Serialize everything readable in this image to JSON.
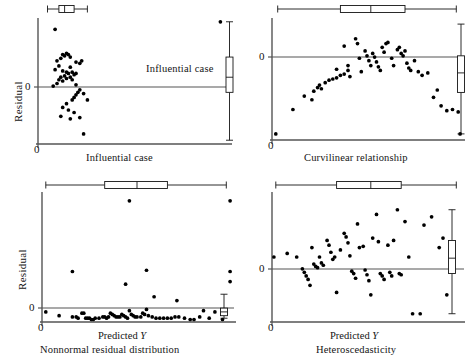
{
  "figure": {
    "title": "",
    "panels": [
      {
        "id": "influential-case",
        "caption": "Influential case",
        "xlabel": "",
        "ylabel": "Residual",
        "zero_tick": "0",
        "x_origin_tick": "0",
        "annotation": "Influential case"
      },
      {
        "id": "curvilinear-relationship",
        "caption": "Curvilinear relationship",
        "xlabel": "",
        "ylabel": "",
        "zero_tick": "0",
        "x_origin_tick": "0",
        "annotation": ""
      },
      {
        "id": "nonnormal-residual-distribution",
        "caption": "Nonnormal residual distribution",
        "xlabel_main": "Predicted",
        "xlabel_var": "Y",
        "ylabel": "Residual",
        "zero_tick": "0",
        "x_origin_tick": "0",
        "annotation": ""
      },
      {
        "id": "heteroscedasticity",
        "caption": "Heteroscedasticity",
        "xlabel_main": "Predicted",
        "xlabel_var": "Y",
        "ylabel": "",
        "zero_tick": "0",
        "x_origin_tick": "0",
        "annotation": ""
      }
    ],
    "colors": {
      "ink": "#141414",
      "axis": "#555555",
      "point": "#000000",
      "page": "#ffffff"
    }
  },
  "chart_data": [
    {
      "type": "scatter",
      "title": "Influential case",
      "xlabel": "",
      "ylabel": "Residual",
      "xlim": [
        0,
        100
      ],
      "ylim": [
        -55,
        45
      ],
      "grid": false,
      "legend": null,
      "annotations": [
        {
          "text": "Influential case",
          "x": 96,
          "y": 6,
          "note": "labels the single far-right outlying point"
        }
      ],
      "reference_lines": [
        {
          "orientation": "horizontal",
          "y": 0
        }
      ],
      "marginal_boxplots": {
        "x": {
          "min": 5,
          "q1": 11,
          "median": 14,
          "q3": 19,
          "max": 26,
          "position": "top"
        },
        "y": {
          "min": -52,
          "q1": -14,
          "median": -2,
          "q3": 14,
          "max": 42,
          "position": "right"
        }
      },
      "points": [
        {
          "x": 9,
          "y": 36
        },
        {
          "x": 13,
          "y": 16
        },
        {
          "x": 15,
          "y": 17
        },
        {
          "x": 14,
          "y": 15
        },
        {
          "x": 16,
          "y": 16
        },
        {
          "x": 17,
          "y": 14
        },
        {
          "x": 12,
          "y": 13
        },
        {
          "x": 10,
          "y": 11
        },
        {
          "x": 20,
          "y": 10
        },
        {
          "x": 23,
          "y": 11
        },
        {
          "x": 22,
          "y": 9
        },
        {
          "x": 11,
          "y": 7
        },
        {
          "x": 17,
          "y": 6
        },
        {
          "x": 9,
          "y": 4
        },
        {
          "x": 13,
          "y": 3
        },
        {
          "x": 15,
          "y": 2
        },
        {
          "x": 16,
          "y": 1
        },
        {
          "x": 18,
          "y": 2
        },
        {
          "x": 19,
          "y": 0
        },
        {
          "x": 20,
          "y": 1
        },
        {
          "x": 14,
          "y": -1
        },
        {
          "x": 12,
          "y": -2
        },
        {
          "x": 17,
          "y": -2
        },
        {
          "x": 15,
          "y": -3
        },
        {
          "x": 11,
          "y": -4
        },
        {
          "x": 13,
          "y": -5
        },
        {
          "x": 18,
          "y": -4
        },
        {
          "x": 10,
          "y": -7
        },
        {
          "x": 8,
          "y": -9
        },
        {
          "x": 20,
          "y": -8
        },
        {
          "x": 22,
          "y": -12
        },
        {
          "x": 21,
          "y": -14
        },
        {
          "x": 20,
          "y": -16
        },
        {
          "x": 19,
          "y": -18
        },
        {
          "x": 18,
          "y": -20
        },
        {
          "x": 24,
          "y": -15
        },
        {
          "x": 26,
          "y": -20
        },
        {
          "x": 15,
          "y": -23
        },
        {
          "x": 13,
          "y": -26
        },
        {
          "x": 16,
          "y": -28
        },
        {
          "x": 19,
          "y": -30
        },
        {
          "x": 12,
          "y": -33
        },
        {
          "x": 17,
          "y": -35
        },
        {
          "x": 22,
          "y": -34
        },
        {
          "x": 24,
          "y": -47
        },
        {
          "x": 96,
          "y": 42
        }
      ]
    },
    {
      "type": "scatter",
      "title": "Curvilinear relationship",
      "xlabel": "",
      "ylabel": "",
      "xlim": [
        0,
        100
      ],
      "ylim": [
        -55,
        45
      ],
      "grid": false,
      "legend": null,
      "annotations": [],
      "reference_lines": [
        {
          "orientation": "horizontal",
          "y": 0
        }
      ],
      "marginal_boxplots": {
        "x": {
          "min": 3,
          "q1": 36,
          "median": 52,
          "q3": 70,
          "max": 97,
          "position": "top"
        },
        "y": {
          "min": -50,
          "q1": -16,
          "median": 0,
          "q3": 14,
          "max": 40,
          "position": "right"
        }
      },
      "points": [
        {
          "x": 2,
          "y": -50
        },
        {
          "x": 11,
          "y": -30
        },
        {
          "x": 17,
          "y": -19
        },
        {
          "x": 21,
          "y": -22
        },
        {
          "x": 22,
          "y": -15
        },
        {
          "x": 24,
          "y": -12
        },
        {
          "x": 25,
          "y": -10
        },
        {
          "x": 26,
          "y": -13
        },
        {
          "x": 28,
          "y": -8
        },
        {
          "x": 30,
          "y": -6
        },
        {
          "x": 32,
          "y": -5
        },
        {
          "x": 34,
          "y": -4
        },
        {
          "x": 36,
          "y": -2
        },
        {
          "x": 34,
          "y": 3
        },
        {
          "x": 38,
          "y": -1
        },
        {
          "x": 40,
          "y": 6
        },
        {
          "x": 40,
          "y": 2
        },
        {
          "x": 41,
          "y": -3
        },
        {
          "x": 38,
          "y": 22
        },
        {
          "x": 44,
          "y": 28
        },
        {
          "x": 45,
          "y": 24
        },
        {
          "x": 46,
          "y": 12
        },
        {
          "x": 47,
          "y": 1
        },
        {
          "x": 49,
          "y": 18
        },
        {
          "x": 50,
          "y": 14
        },
        {
          "x": 51,
          "y": 10
        },
        {
          "x": 52,
          "y": 6
        },
        {
          "x": 53,
          "y": 16
        },
        {
          "x": 54,
          "y": 13
        },
        {
          "x": 55,
          "y": 9
        },
        {
          "x": 56,
          "y": 5
        },
        {
          "x": 57,
          "y": 2
        },
        {
          "x": 58,
          "y": 21
        },
        {
          "x": 59,
          "y": 17
        },
        {
          "x": 60,
          "y": 24
        },
        {
          "x": 61,
          "y": 25
        },
        {
          "x": 63,
          "y": 12
        },
        {
          "x": 64,
          "y": 6
        },
        {
          "x": 66,
          "y": 19
        },
        {
          "x": 67,
          "y": 21
        },
        {
          "x": 68,
          "y": 16
        },
        {
          "x": 69,
          "y": 14
        },
        {
          "x": 70,
          "y": 18
        },
        {
          "x": 71,
          "y": 8
        },
        {
          "x": 72,
          "y": 4
        },
        {
          "x": 73,
          "y": 2
        },
        {
          "x": 75,
          "y": 10
        },
        {
          "x": 77,
          "y": 1
        },
        {
          "x": 79,
          "y": -2
        },
        {
          "x": 82,
          "y": 0
        },
        {
          "x": 85,
          "y": -20
        },
        {
          "x": 87,
          "y": -14
        },
        {
          "x": 89,
          "y": -27
        },
        {
          "x": 92,
          "y": -31
        },
        {
          "x": 95,
          "y": -30
        },
        {
          "x": 98,
          "y": -32
        },
        {
          "x": 99,
          "y": -50
        }
      ]
    },
    {
      "type": "scatter",
      "title": "Nonnormal residual distribution",
      "xlabel": "Predicted Y",
      "ylabel": "Residual",
      "xlim": [
        0,
        100
      ],
      "ylim": [
        -8,
        95
      ],
      "grid": false,
      "legend": null,
      "annotations": [],
      "reference_lines": [
        {
          "orientation": "horizontal",
          "y": 0
        }
      ],
      "marginal_boxplots": {
        "x": {
          "min": 2,
          "q1": 33,
          "median": 50,
          "q3": 66,
          "max": 97,
          "position": "top"
        },
        "y": {
          "min": -5,
          "q1": -3,
          "median": 0,
          "q3": 3,
          "max": 14,
          "position": "right"
        }
      },
      "points": [
        {
          "x": 46,
          "y": 88
        },
        {
          "x": 99,
          "y": 88
        },
        {
          "x": 16,
          "y": 32
        },
        {
          "x": 55,
          "y": 33
        },
        {
          "x": 99,
          "y": 32
        },
        {
          "x": 99,
          "y": 24
        },
        {
          "x": 44,
          "y": 22
        },
        {
          "x": 59,
          "y": 12
        },
        {
          "x": 71,
          "y": 9
        },
        {
          "x": 2,
          "y": 0
        },
        {
          "x": 9,
          "y": -3
        },
        {
          "x": 16,
          "y": -4
        },
        {
          "x": 18,
          "y": -4
        },
        {
          "x": 19,
          "y": -5
        },
        {
          "x": 21,
          "y": -1
        },
        {
          "x": 22,
          "y": -1
        },
        {
          "x": 23,
          "y": -5
        },
        {
          "x": 24,
          "y": -5
        },
        {
          "x": 25,
          "y": -5
        },
        {
          "x": 26,
          "y": -6
        },
        {
          "x": 27,
          "y": -6
        },
        {
          "x": 28,
          "y": -5
        },
        {
          "x": 30,
          "y": -5
        },
        {
          "x": 32,
          "y": -4
        },
        {
          "x": 33,
          "y": -4
        },
        {
          "x": 34,
          "y": -5
        },
        {
          "x": 35,
          "y": -4
        },
        {
          "x": 36,
          "y": -1
        },
        {
          "x": 37,
          "y": -2
        },
        {
          "x": 38,
          "y": -3
        },
        {
          "x": 39,
          "y": -4
        },
        {
          "x": 40,
          "y": -4
        },
        {
          "x": 41,
          "y": -4
        },
        {
          "x": 42,
          "y": -2
        },
        {
          "x": 43,
          "y": -3
        },
        {
          "x": 44,
          "y": -4
        },
        {
          "x": 45,
          "y": -5
        },
        {
          "x": 46,
          "y": 1
        },
        {
          "x": 47,
          "y": -2
        },
        {
          "x": 48,
          "y": -3
        },
        {
          "x": 49,
          "y": -4
        },
        {
          "x": 50,
          "y": -4
        },
        {
          "x": 52,
          "y": -4
        },
        {
          "x": 53,
          "y": -1
        },
        {
          "x": 54,
          "y": -2
        },
        {
          "x": 55,
          "y": 2
        },
        {
          "x": 56,
          "y": -3
        },
        {
          "x": 58,
          "y": -4
        },
        {
          "x": 60,
          "y": -5
        },
        {
          "x": 62,
          "y": -5
        },
        {
          "x": 64,
          "y": -5
        },
        {
          "x": 66,
          "y": -5
        },
        {
          "x": 68,
          "y": -5
        },
        {
          "x": 70,
          "y": -4
        },
        {
          "x": 72,
          "y": -4
        },
        {
          "x": 75,
          "y": -5
        },
        {
          "x": 78,
          "y": -6
        },
        {
          "x": 80,
          "y": -6
        },
        {
          "x": 83,
          "y": -4
        },
        {
          "x": 85,
          "y": 1
        },
        {
          "x": 88,
          "y": -5
        },
        {
          "x": 91,
          "y": 0
        },
        {
          "x": 95,
          "y": -6
        }
      ]
    },
    {
      "type": "scatter",
      "title": "Heteroscedasticity",
      "xlabel": "Predicted Y",
      "ylabel": "",
      "xlim": [
        0,
        100
      ],
      "ylim": [
        -55,
        55
      ],
      "grid": false,
      "legend": null,
      "annotations": [],
      "reference_lines": [
        {
          "orientation": "horizontal",
          "y": 0
        }
      ],
      "marginal_boxplots": {
        "x": {
          "min": 2,
          "q1": 34,
          "median": 52,
          "q3": 68,
          "max": 97,
          "position": "top"
        },
        "y": {
          "min": -48,
          "q1": -14,
          "median": -1,
          "q3": 14,
          "max": 40,
          "position": "right"
        },
        "y_outliers": [
          52,
          48
        ]
      },
      "points": [
        {
          "x": 1,
          "y": 0
        },
        {
          "x": 8,
          "y": 3
        },
        {
          "x": 13,
          "y": 0
        },
        {
          "x": 16,
          "y": -10
        },
        {
          "x": 17,
          "y": -13
        },
        {
          "x": 18,
          "y": -16
        },
        {
          "x": 19,
          "y": -19
        },
        {
          "x": 20,
          "y": -24
        },
        {
          "x": 21,
          "y": 8
        },
        {
          "x": 22,
          "y": -6
        },
        {
          "x": 23,
          "y": -8
        },
        {
          "x": 24,
          "y": -9
        },
        {
          "x": 25,
          "y": 0
        },
        {
          "x": 26,
          "y": -5
        },
        {
          "x": 27,
          "y": -7
        },
        {
          "x": 29,
          "y": 14
        },
        {
          "x": 30,
          "y": 10
        },
        {
          "x": 31,
          "y": 4
        },
        {
          "x": 32,
          "y": -2
        },
        {
          "x": 33,
          "y": 0
        },
        {
          "x": 34,
          "y": -30
        },
        {
          "x": 36,
          "y": 6
        },
        {
          "x": 38,
          "y": 20
        },
        {
          "x": 39,
          "y": 17
        },
        {
          "x": 40,
          "y": 12
        },
        {
          "x": 41,
          "y": 1
        },
        {
          "x": 42,
          "y": -12
        },
        {
          "x": 43,
          "y": -14
        },
        {
          "x": 44,
          "y": -18
        },
        {
          "x": 45,
          "y": 28
        },
        {
          "x": 46,
          "y": 8
        },
        {
          "x": 48,
          "y": 9
        },
        {
          "x": 49,
          "y": -11
        },
        {
          "x": 50,
          "y": -15
        },
        {
          "x": 51,
          "y": -20
        },
        {
          "x": 52,
          "y": -32
        },
        {
          "x": 53,
          "y": 16
        },
        {
          "x": 55,
          "y": 36
        },
        {
          "x": 56,
          "y": 13
        },
        {
          "x": 57,
          "y": -14
        },
        {
          "x": 58,
          "y": -16
        },
        {
          "x": 59,
          "y": -19
        },
        {
          "x": 61,
          "y": 10
        },
        {
          "x": 62,
          "y": -13
        },
        {
          "x": 63,
          "y": -16
        },
        {
          "x": 64,
          "y": 14
        },
        {
          "x": 66,
          "y": 40
        },
        {
          "x": 67,
          "y": -14
        },
        {
          "x": 68,
          "y": -15
        },
        {
          "x": 70,
          "y": 30
        },
        {
          "x": 72,
          "y": 0
        },
        {
          "x": 74,
          "y": -48
        },
        {
          "x": 78,
          "y": -48
        },
        {
          "x": 80,
          "y": 27
        },
        {
          "x": 84,
          "y": 34
        },
        {
          "x": 88,
          "y": 8
        },
        {
          "x": 90,
          "y": 16
        },
        {
          "x": 92,
          "y": -32
        }
      ]
    }
  ]
}
